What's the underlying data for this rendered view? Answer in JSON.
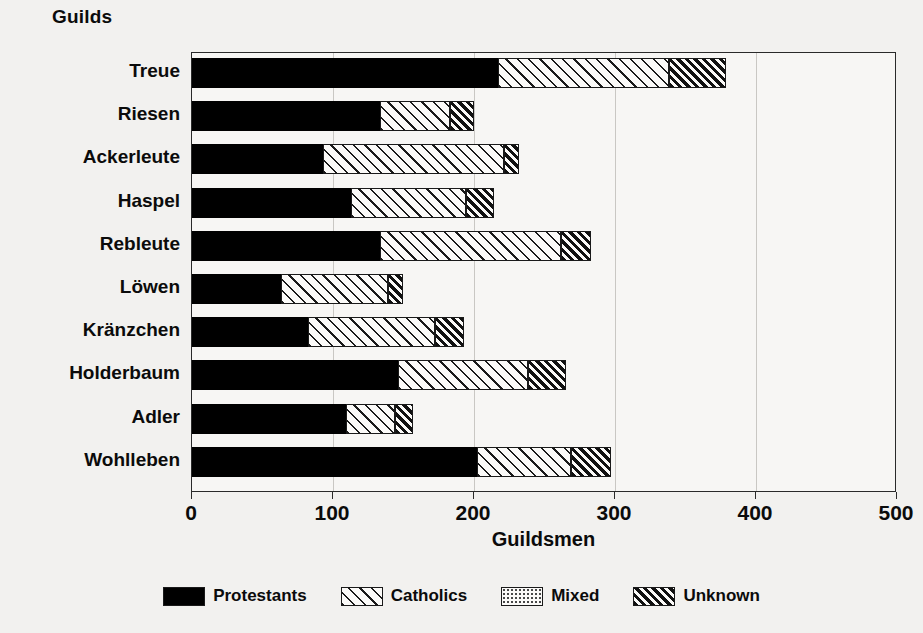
{
  "chart_data": {
    "type": "bar",
    "orientation": "horizontal",
    "stacked": true,
    "title": "",
    "ylabel": "Guilds",
    "xlabel": "Guildsmen",
    "xlim": [
      0,
      500
    ],
    "xticks": [
      0,
      100,
      200,
      300,
      400,
      500
    ],
    "xtick_labels": [
      "0",
      "100",
      "200",
      "300",
      "400",
      "500"
    ],
    "grid": true,
    "legend_position": "bottom",
    "categories": [
      "Treue",
      "Riesen",
      "Ackerleute",
      "Haspel",
      "Rebleute",
      "Löwen",
      "Kränzchen",
      "Holderbaum",
      "Adler",
      "Wohlleben"
    ],
    "series": [
      {
        "name": "Protestants",
        "pattern": "solid-black",
        "color": "#000000",
        "values": [
          217,
          133,
          93,
          113,
          133,
          63,
          82,
          146,
          109,
          202
        ]
      },
      {
        "name": "Catholics",
        "pattern": "diagonal-hatch",
        "color": "#ffffff",
        "values": [
          121,
          50,
          128,
          81,
          129,
          76,
          90,
          92,
          35,
          67
        ]
      },
      {
        "name": "Mixed",
        "pattern": "dotted",
        "color": "#ffffff",
        "values": [
          0,
          0,
          0,
          0,
          0,
          0,
          0,
          0,
          0,
          0
        ]
      },
      {
        "name": "Unknown",
        "pattern": "dense-diagonal-hatch",
        "color": "#ffffff",
        "values": [
          41,
          17,
          11,
          20,
          21,
          11,
          21,
          27,
          13,
          28
        ]
      }
    ],
    "totals": [
      379,
      200,
      232,
      214,
      283,
      150,
      193,
      265,
      157,
      297
    ]
  },
  "legend": {
    "items": [
      {
        "label": "Protestants",
        "key": "protestants"
      },
      {
        "label": "Catholics",
        "key": "catholics"
      },
      {
        "label": "Mixed",
        "key": "mixed"
      },
      {
        "label": "Unknown",
        "key": "unknown"
      }
    ]
  }
}
